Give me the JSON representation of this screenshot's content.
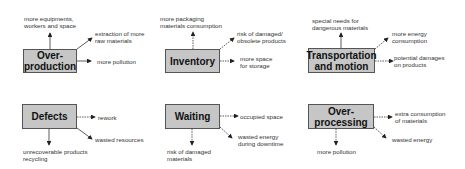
{
  "diagram": {
    "wastes": [
      {
        "name": "Over-\nproduction",
        "label": "Over-production",
        "effects": [
          "more equipments, workers and space",
          "extraction of more raw materials",
          "more pollution"
        ]
      },
      {
        "name": "Inventory",
        "effects": [
          "more packaging materials consumption",
          "risk of damaged/ obsolete products",
          "more space for storage"
        ]
      },
      {
        "name": "Transportation and motion",
        "effects": [
          "special needs for dangerous materials",
          "more energy consumption",
          "potential damages on products"
        ]
      },
      {
        "name": "Defects",
        "effects": [
          "rework",
          "wasted resources",
          "unrecoverable products recycling"
        ]
      },
      {
        "name": "Waiting",
        "effects": [
          "occupied space",
          "wasted energy during downtime",
          "risk of damaged materials"
        ]
      },
      {
        "name": "Over-processing",
        "effects": [
          "extra consumption of materials",
          "wasted energy",
          "more pollution"
        ]
      }
    ],
    "colors": {
      "box_fill": "#c6c6c6",
      "box_border": "#555555",
      "arrow": "#222222"
    }
  },
  "boxes": {
    "b0": [
      "Over-",
      "production"
    ],
    "b1": "Inventory",
    "b2": [
      "Transportation",
      "and motion"
    ],
    "b3": "Defects",
    "b4": "Waiting",
    "b5": [
      "Over-",
      "processing"
    ]
  },
  "labels": {
    "l0a": [
      "more equipments,",
      "workers and space"
    ],
    "l0b": [
      "extraction of more",
      "raw materials"
    ],
    "l0c": "more pollution",
    "l1a": [
      "more packaging",
      "materials consumption"
    ],
    "l1b": [
      "risk of damaged/",
      "obsolete products"
    ],
    "l1c": [
      "more space",
      "for storage"
    ],
    "l2a": [
      "special needs for",
      "dangerous materials"
    ],
    "l2b": [
      "more energy",
      "consumption"
    ],
    "l2c": [
      "potential damages",
      "on products"
    ],
    "l3a": "rework",
    "l3b": "wasted resources",
    "l3c": [
      "unrecoverable products",
      "recycling"
    ],
    "l4a": "occupied space",
    "l4b": [
      "wasted energy",
      "during downtime"
    ],
    "l4c": [
      "risk of damaged",
      "materials"
    ],
    "l5a": [
      "extra consumption",
      "of materials"
    ],
    "l5b": "wasted energy",
    "l5c": "more pollution"
  }
}
